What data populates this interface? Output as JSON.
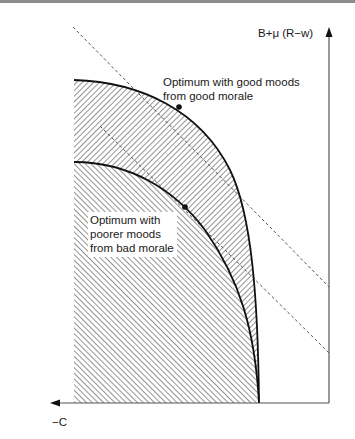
{
  "diagram": {
    "axes": {
      "y_label": "B+μ (R−w)",
      "x_label": "−C"
    },
    "annotations": {
      "good_optimum": [
        "Optimum with good moods",
        "from good morale"
      ],
      "bad_optimum": [
        "Optimum with",
        "poorer moods",
        "from bad morale"
      ]
    },
    "curves": [
      {
        "name": "outer-frontier",
        "description": "Feasible frontier with good morale",
        "hatch": "forward-slash"
      },
      {
        "name": "inner-frontier",
        "description": "Feasible frontier with bad morale",
        "hatch": "back-slash"
      }
    ],
    "tangent_lines": [
      {
        "name": "good-morale-tangent",
        "style": "dashed"
      },
      {
        "name": "bad-morale-tangent",
        "style": "dashed"
      }
    ],
    "colors": {
      "line": "#111111",
      "dashed": "#555555",
      "hatch": "#3a3a3a",
      "border": "#8c8c8c",
      "background": "#ffffff"
    }
  }
}
